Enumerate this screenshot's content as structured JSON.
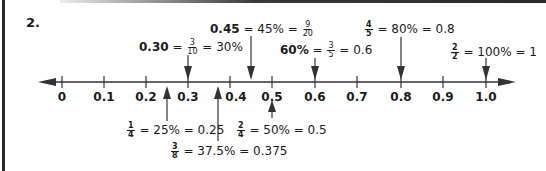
{
  "question_number": "2.",
  "number_line": {
    "ticks": [
      "0",
      "0.1",
      "0.2",
      "0.3",
      "0.4",
      "0.5",
      "0.6",
      "0.7",
      "0.8",
      "0.9",
      "1.0"
    ]
  },
  "annotations_above": [
    {
      "id": "a030",
      "bold": "0.30",
      "eq1": " = ",
      "frac_num": "3",
      "frac_den": "10",
      "eq2": " = 30%",
      "value": 0.3
    },
    {
      "id": "a045",
      "bold": "0.45",
      "eq1": " = 45% = ",
      "frac_num": "9",
      "frac_den": "20",
      "value": 0.45
    },
    {
      "id": "a060",
      "bold": "60%",
      "eq1": " = ",
      "frac_num": "3",
      "frac_den": "5",
      "eq2": " = 0.6",
      "value": 0.6
    },
    {
      "id": "a080",
      "frac_num": "4",
      "frac_den": "5",
      "eq2": " = 80% = 0.8",
      "value": 0.8
    },
    {
      "id": "a100",
      "frac_num": "2",
      "frac_den": "2",
      "eq2": " = 100% = 1",
      "value": 1.0
    }
  ],
  "annotations_below": [
    {
      "id": "b025",
      "frac_num": "1",
      "frac_den": "4",
      "eq2": " = 25% = 0.25",
      "value": 0.25
    },
    {
      "id": "b0375",
      "frac_num": "3",
      "frac_den": "8",
      "eq2": " = 37.5% = 0.375",
      "value": 0.375
    },
    {
      "id": "b050",
      "frac_num": "2",
      "frac_den": "4",
      "eq2": " = 50% = 0.5",
      "value": 0.5
    }
  ]
}
